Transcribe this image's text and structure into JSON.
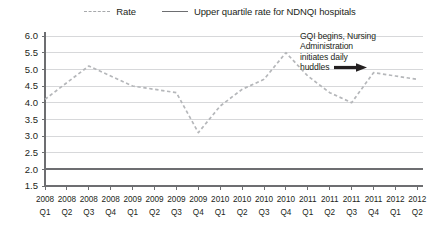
{
  "legend": {
    "entries": [
      {
        "label": "Rate",
        "style": "dashed",
        "icon": "dashed-line-icon",
        "color": "#b5b7ba"
      },
      {
        "label": "Upper quartile rate for NDNQI hospitals",
        "style": "solid",
        "icon": "solid-line-icon",
        "color": "#6d6e71"
      }
    ]
  },
  "annotation": {
    "line1": "GQI begins, Nursing",
    "line2": "Administration",
    "line3": "initiates daily",
    "line4": "huddles",
    "arrow_icon": "right-arrow-icon"
  },
  "chart_data": {
    "type": "line",
    "title": "",
    "xlabel": "",
    "ylabel": "",
    "ylim": [
      1.5,
      6.0
    ],
    "yticks": [
      "6.0",
      "5.5",
      "5.0",
      "4.5",
      "4.0",
      "3.5",
      "3.0",
      "2.5",
      "2.0",
      "1.5"
    ],
    "ytick_values": [
      6.0,
      5.5,
      5.0,
      4.5,
      4.0,
      3.5,
      3.0,
      2.5,
      2.0,
      1.5
    ],
    "grid": true,
    "legend_position": "top-center",
    "categories": [
      "2008 Q1",
      "2008 Q2",
      "2008 Q3",
      "2008 Q4",
      "2009 Q1",
      "2009 Q2",
      "2009 Q3",
      "2009 Q4",
      "2010 Q1",
      "2010 Q2",
      "2010 Q3",
      "2010 Q4",
      "2011 Q1",
      "2011 Q2",
      "2011 Q3",
      "2011 Q4",
      "2012 Q1",
      "2012 Q2"
    ],
    "xtick_years": [
      "2008",
      "2008",
      "2008",
      "2008",
      "2009",
      "2009",
      "2009",
      "2009",
      "2010",
      "2010",
      "2010",
      "2010",
      "2011",
      "2011",
      "2011",
      "2011",
      "2012",
      "2012"
    ],
    "xtick_quarters": [
      "Q1",
      "Q2",
      "Q3",
      "Q4",
      "Q1",
      "Q2",
      "Q3",
      "Q4",
      "Q1",
      "Q2",
      "Q3",
      "Q4",
      "Q1",
      "Q2",
      "Q3",
      "Q4",
      "Q1",
      "Q2"
    ],
    "series": [
      {
        "name": "Rate",
        "style": "dashed",
        "color": "#b5b7ba",
        "values": [
          4.1,
          4.6,
          5.1,
          4.8,
          4.5,
          4.4,
          4.3,
          3.1,
          3.9,
          4.4,
          4.7,
          5.5,
          4.8,
          4.3,
          4.0,
          4.9,
          4.8,
          4.7
        ]
      },
      {
        "name": "Upper quartile rate for NDNQI hospitals",
        "style": "solid",
        "color": "#6d6e71",
        "constant": 2.0
      }
    ]
  }
}
